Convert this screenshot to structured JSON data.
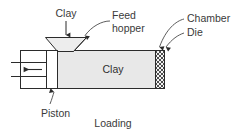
{
  "diagram": {
    "title": "Loading",
    "caption": "Loading",
    "labels": {
      "clay_top": "Clay",
      "feed_hopper_line1": "Feed",
      "feed_hopper_line2": "hopper",
      "chamber": "Chamber",
      "die": "Die",
      "piston": "Piston",
      "clay_inner": "Clay"
    },
    "colors": {
      "stroke": "#2b2b2b",
      "leader": "#4a4a4a",
      "text": "#3a3a3a",
      "clay_fill": "#e8e8e8",
      "hopper_fill": "#ededed",
      "die_fill": "#f2f2f2",
      "die_hatch": "#3a3a3a",
      "background": "#ffffff"
    },
    "parts": [
      {
        "name": "piston",
        "label": "Piston"
      },
      {
        "name": "feed-hopper",
        "label": "Feed hopper"
      },
      {
        "name": "chamber",
        "label": "Chamber"
      },
      {
        "name": "die",
        "label": "Die"
      },
      {
        "name": "clay-charge",
        "label": "Clay"
      }
    ],
    "arrows": [
      {
        "name": "clay-feed-arrow",
        "direction": "down"
      },
      {
        "name": "piston-motion-arrow",
        "direction": "left"
      },
      {
        "name": "chamber-leader-arrow",
        "direction": "down"
      },
      {
        "name": "die-leader-arrow",
        "direction": "down"
      },
      {
        "name": "piston-leader-arrow",
        "direction": "up"
      }
    ]
  }
}
